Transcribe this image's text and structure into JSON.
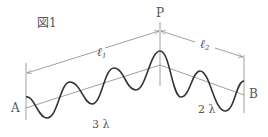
{
  "figure": {
    "title": "図1",
    "point_top": "P",
    "point_left": "A",
    "point_right": "B",
    "length_left": "ℓ",
    "length_left_sub": "1",
    "length_right": "ℓ",
    "length_right_sub": "2",
    "wavelengths_left": "3 λ",
    "wavelengths_right": "2 λ",
    "colors": {
      "wave": "#333333",
      "lines": "#888888",
      "text": "#555555"
    }
  }
}
